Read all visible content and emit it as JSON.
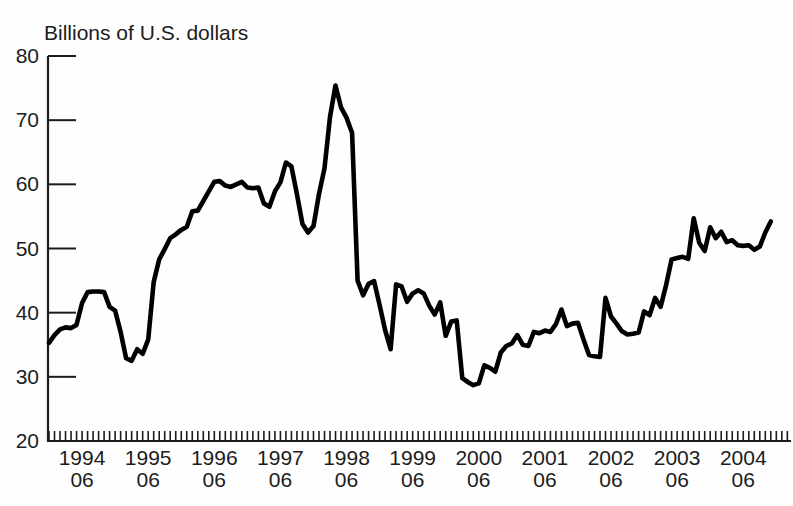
{
  "chart_data": {
    "type": "line",
    "title": "Billions of U.S. dollars",
    "xlabel": "",
    "ylabel": "Billions of U.S. dollars",
    "ylim": [
      20,
      80
    ],
    "yticks": [
      20,
      30,
      40,
      50,
      60,
      70,
      80
    ],
    "grid": false,
    "legend": "none",
    "line_color": "#000000",
    "axis_color": "#1c1c1c",
    "x_tick_unit": "month",
    "xtick_labels": [
      {
        "line1": "1994",
        "line2": "06"
      },
      {
        "line1": "1995",
        "line2": "06"
      },
      {
        "line1": "1996",
        "line2": "06"
      },
      {
        "line1": "1997",
        "line2": "06"
      },
      {
        "line1": "1998",
        "line2": "06"
      },
      {
        "line1": "1999",
        "line2": "06"
      },
      {
        "line1": "2000",
        "line2": "06"
      },
      {
        "line1": "2001",
        "line2": "06"
      },
      {
        "line1": "2002",
        "line2": "06"
      },
      {
        "line1": "2003",
        "line2": "06"
      },
      {
        "line1": "2004",
        "line2": "06"
      }
    ],
    "x": [
      "1993-12",
      "1994-01",
      "1994-02",
      "1994-03",
      "1994-04",
      "1994-05",
      "1994-06",
      "1994-07",
      "1994-08",
      "1994-09",
      "1994-10",
      "1994-11",
      "1994-12",
      "1995-01",
      "1995-02",
      "1995-03",
      "1995-04",
      "1995-05",
      "1995-06",
      "1995-07",
      "1995-08",
      "1995-09",
      "1995-10",
      "1995-11",
      "1995-12",
      "1996-01",
      "1996-02",
      "1996-03",
      "1996-04",
      "1996-05",
      "1996-06",
      "1996-07",
      "1996-08",
      "1996-09",
      "1996-10",
      "1996-11",
      "1996-12",
      "1997-01",
      "1997-02",
      "1997-03",
      "1997-04",
      "1997-05",
      "1997-06",
      "1997-07",
      "1997-08",
      "1997-09",
      "1997-10",
      "1997-11",
      "1997-12",
      "1998-01",
      "1998-02",
      "1998-03",
      "1998-04",
      "1998-05",
      "1998-06",
      "1998-07",
      "1998-08",
      "1998-09",
      "1998-10",
      "1998-11",
      "1998-12",
      "1999-01",
      "1999-02",
      "1999-03",
      "1999-04",
      "1999-05",
      "1999-06",
      "1999-07",
      "1999-08",
      "1999-09",
      "1999-10",
      "1999-11",
      "1999-12",
      "2000-01",
      "2000-02",
      "2000-03",
      "2000-04",
      "2000-05",
      "2000-06",
      "2000-07",
      "2000-08",
      "2000-09",
      "2000-10",
      "2000-11",
      "2000-12",
      "2001-01",
      "2001-02",
      "2001-03",
      "2001-04",
      "2001-05",
      "2001-06",
      "2001-07",
      "2001-08",
      "2001-09",
      "2001-10",
      "2001-11",
      "2001-12",
      "2002-01",
      "2002-02",
      "2002-03",
      "2002-04",
      "2002-05",
      "2002-06",
      "2002-07",
      "2002-08",
      "2002-09",
      "2002-10",
      "2002-11",
      "2002-12",
      "2003-01",
      "2003-02",
      "2003-03",
      "2003-04",
      "2003-05",
      "2003-06",
      "2003-07",
      "2003-08",
      "2003-09",
      "2003-10",
      "2003-11",
      "2003-12",
      "2004-01",
      "2004-02",
      "2004-03",
      "2004-04",
      "2004-05",
      "2004-06",
      "2004-07",
      "2004-08",
      "2004-09",
      "2004-10",
      "2004-11"
    ],
    "values": [
      35.3,
      36.5,
      37.4,
      37.7,
      37.6,
      38.1,
      41.5,
      43.2,
      43.3,
      43.3,
      43.2,
      40.9,
      40.3,
      37.0,
      32.9,
      32.5,
      34.3,
      33.6,
      35.8,
      44.8,
      48.3,
      49.9,
      51.6,
      52.2,
      52.9,
      53.4,
      55.8,
      55.9,
      57.4,
      58.9,
      60.4,
      60.5,
      59.8,
      59.6,
      60.0,
      60.4,
      59.5,
      59.4,
      59.5,
      57.0,
      56.5,
      58.9,
      60.3,
      63.4,
      62.8,
      58.5,
      53.8,
      52.5,
      53.5,
      58.5,
      62.5,
      70.5,
      75.4,
      72.0,
      70.4,
      68.0,
      45.0,
      42.7,
      44.5,
      44.9,
      41.2,
      37.3,
      34.3,
      44.4,
      44.1,
      41.7,
      43.0,
      43.5,
      43.0,
      41.1,
      39.7,
      41.6,
      36.4,
      38.6,
      38.8,
      29.8,
      29.2,
      28.7,
      29.0,
      31.8,
      31.4,
      30.8,
      33.8,
      34.8,
      35.2,
      36.5,
      35.0,
      34.8,
      37.0,
      36.8,
      37.2,
      37.0,
      38.2,
      40.5,
      37.9,
      38.3,
      38.4,
      35.8,
      33.4,
      33.2,
      33.1,
      42.3,
      39.4,
      38.3,
      37.1,
      36.6,
      36.7,
      36.9,
      40.2,
      39.6,
      42.3,
      40.9,
      44.3,
      48.3,
      48.5,
      48.7,
      48.4,
      54.7,
      50.9,
      49.6,
      53.3,
      51.6,
      52.6,
      51.0,
      51.3,
      50.5,
      50.4,
      50.5,
      49.8,
      50.3,
      52.5,
      54.2
    ]
  }
}
